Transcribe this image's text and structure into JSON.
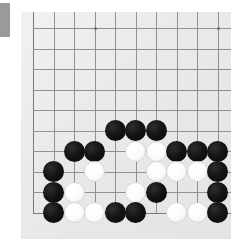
{
  "app": {
    "title": "Go board photograph",
    "kind": "go-game-position"
  },
  "side_tab": {
    "name": "side-tab",
    "color": "#9a9a9a"
  },
  "board": {
    "game": "Go",
    "board_size": 19,
    "visible_region": "bottom-left corner area of the board",
    "paper_color": "#ececeb",
    "line_color": "#8f9295",
    "black_color": "#141414",
    "white_color": "#fbfbfb",
    "origin_x": 33,
    "origin_y": 28,
    "spacing": 20.5,
    "cols": 10,
    "rows": 10,
    "stone_radius": 10.5,
    "hoshi": [
      {
        "col": 3,
        "row": 0
      },
      {
        "col": 9,
        "row": 0
      }
    ],
    "edges": {
      "left_col": 0,
      "bottom_row": 9
    },
    "stones": [
      {
        "color": "black",
        "col": 4,
        "row": 5
      },
      {
        "color": "black",
        "col": 5,
        "row": 5
      },
      {
        "color": "black",
        "col": 6,
        "row": 5
      },
      {
        "color": "black",
        "col": 2,
        "row": 6
      },
      {
        "color": "black",
        "col": 3,
        "row": 6
      },
      {
        "color": "white",
        "col": 5,
        "row": 6
      },
      {
        "color": "white",
        "col": 6,
        "row": 6
      },
      {
        "color": "black",
        "col": 7,
        "row": 6
      },
      {
        "color": "black",
        "col": 8,
        "row": 6
      },
      {
        "color": "black",
        "col": 9,
        "row": 6
      },
      {
        "color": "black",
        "col": 1,
        "row": 7
      },
      {
        "color": "white",
        "col": 3,
        "row": 7
      },
      {
        "color": "white",
        "col": 6,
        "row": 7
      },
      {
        "color": "white",
        "col": 7,
        "row": 7
      },
      {
        "color": "white",
        "col": 8,
        "row": 7
      },
      {
        "color": "black",
        "col": 9,
        "row": 7
      },
      {
        "color": "black",
        "col": 1,
        "row": 8
      },
      {
        "color": "white",
        "col": 2,
        "row": 8
      },
      {
        "color": "white",
        "col": 5,
        "row": 8
      },
      {
        "color": "black",
        "col": 6,
        "row": 8
      },
      {
        "color": "black",
        "col": 9,
        "row": 8
      },
      {
        "color": "black",
        "col": 1,
        "row": 9
      },
      {
        "color": "white",
        "col": 2,
        "row": 9
      },
      {
        "color": "white",
        "col": 3,
        "row": 9
      },
      {
        "color": "black",
        "col": 4,
        "row": 9
      },
      {
        "color": "black",
        "col": 5,
        "row": 9
      },
      {
        "color": "white",
        "col": 7,
        "row": 9
      },
      {
        "color": "white",
        "col": 8,
        "row": 9
      },
      {
        "color": "black",
        "col": 9,
        "row": 9
      }
    ]
  }
}
